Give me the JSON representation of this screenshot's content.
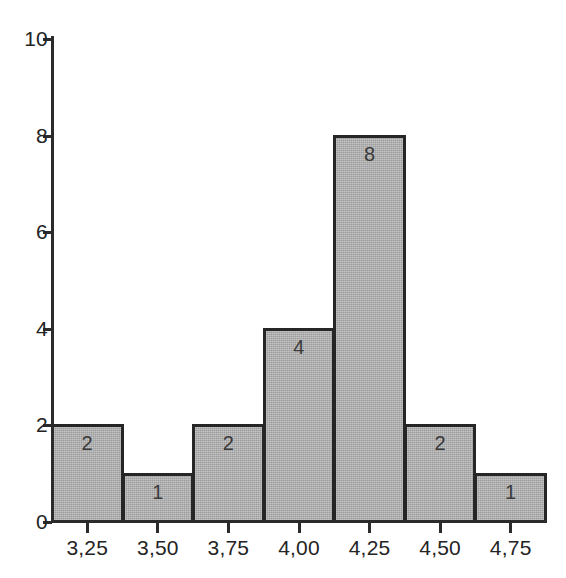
{
  "chart_data": {
    "type": "bar",
    "title": "",
    "subtitle": "",
    "xlabel": "",
    "ylabel": "",
    "categories": [
      "3,25",
      "3,50",
      "3,75",
      "4,00",
      "4,25",
      "4,50",
      "4,75"
    ],
    "values": [
      2,
      1,
      2,
      4,
      8,
      2,
      1
    ],
    "bar_labels": [
      "2",
      "1",
      "2",
      "4",
      "8",
      "2",
      "1"
    ],
    "xlim": [
      3.125,
      4.875
    ],
    "ylim": [
      0,
      10
    ],
    "x_tick_labels": [
      "3,25",
      "3,50",
      "3,75",
      "4,00",
      "4,25",
      "4,50",
      "4,75"
    ],
    "y_tick_labels": [
      "0",
      "2",
      "4",
      "6",
      "8",
      "10"
    ],
    "y_tick_values": [
      0,
      2,
      4,
      6,
      8,
      10
    ],
    "grid": false,
    "legend": null,
    "bin_width": 0.25,
    "colors": {
      "bar_fill": "#aeaeae",
      "bar_border": "#262626",
      "axis": "#2b2b2b",
      "tick_text": "#242424",
      "bar_label_text": "#3a3a3a",
      "background": "#ffffff"
    }
  },
  "axes": {
    "y_ticks": [
      {
        "label": "10",
        "value": 10
      },
      {
        "label": "8",
        "value": 8
      },
      {
        "label": "6",
        "value": 6
      },
      {
        "label": "4",
        "value": 4
      },
      {
        "label": "2",
        "value": 2
      },
      {
        "label": "0",
        "value": 0
      }
    ],
    "x_ticks": [
      {
        "label": "3,25"
      },
      {
        "label": "3,50"
      },
      {
        "label": "3,75"
      },
      {
        "label": "4,00"
      },
      {
        "label": "4,25"
      },
      {
        "label": "4,50"
      },
      {
        "label": "4,75"
      }
    ]
  }
}
